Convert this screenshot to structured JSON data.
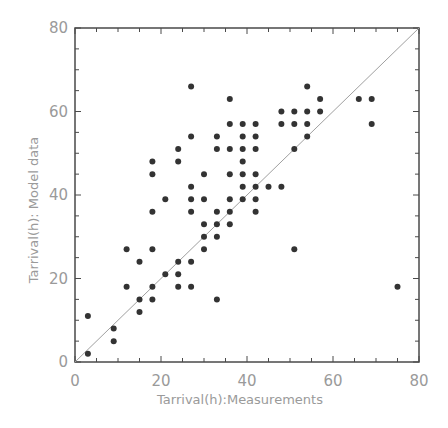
{
  "chart_data": {
    "type": "scatter",
    "title": "",
    "xlabel": "Tarrival(h):Measurements",
    "ylabel": "Tarrival(h): Model data",
    "xlim": [
      0,
      80
    ],
    "ylim": [
      0,
      80
    ],
    "x_ticks": [
      "0",
      "20",
      "40",
      "60",
      "80"
    ],
    "y_ticks": [
      "0",
      "20",
      "40",
      "60",
      "80"
    ],
    "grid": false,
    "legend": null,
    "reference_line": {
      "label": "1:1 line",
      "from": [
        0,
        0
      ],
      "to": [
        80,
        80
      ]
    },
    "series": [
      {
        "name": "points",
        "points": [
          [
            3,
            2
          ],
          [
            3,
            11
          ],
          [
            9,
            8
          ],
          [
            9,
            5
          ],
          [
            12,
            18
          ],
          [
            12,
            27
          ],
          [
            15,
            15
          ],
          [
            15,
            12
          ],
          [
            15,
            24
          ],
          [
            18,
            18
          ],
          [
            18,
            15
          ],
          [
            18,
            27
          ],
          [
            18,
            36
          ],
          [
            18,
            45
          ],
          [
            18,
            48
          ],
          [
            21,
            21
          ],
          [
            21,
            39
          ],
          [
            24,
            24
          ],
          [
            24,
            21
          ],
          [
            24,
            18
          ],
          [
            24,
            48
          ],
          [
            24,
            51
          ],
          [
            27,
            24
          ],
          [
            27,
            18
          ],
          [
            27,
            36
          ],
          [
            27,
            39
          ],
          [
            27,
            42
          ],
          [
            27,
            54
          ],
          [
            27,
            66
          ],
          [
            30,
            30
          ],
          [
            30,
            27
          ],
          [
            30,
            33
          ],
          [
            30,
            39
          ],
          [
            30,
            45
          ],
          [
            33,
            33
          ],
          [
            33,
            30
          ],
          [
            33,
            36
          ],
          [
            33,
            15
          ],
          [
            33,
            51
          ],
          [
            33,
            54
          ],
          [
            36,
            36
          ],
          [
            36,
            33
          ],
          [
            36,
            39
          ],
          [
            36,
            45
          ],
          [
            36,
            51
          ],
          [
            36,
            57
          ],
          [
            36,
            63
          ],
          [
            39,
            39
          ],
          [
            39,
            42
          ],
          [
            39,
            45
          ],
          [
            39,
            48
          ],
          [
            39,
            51
          ],
          [
            39,
            54
          ],
          [
            39,
            57
          ],
          [
            42,
            42
          ],
          [
            42,
            36
          ],
          [
            42,
            39
          ],
          [
            42,
            45
          ],
          [
            42,
            51
          ],
          [
            42,
            54
          ],
          [
            42,
            57
          ],
          [
            45,
            42
          ],
          [
            48,
            42
          ],
          [
            48,
            57
          ],
          [
            48,
            60
          ],
          [
            51,
            51
          ],
          [
            51,
            57
          ],
          [
            51,
            60
          ],
          [
            51,
            27
          ],
          [
            54,
            54
          ],
          [
            54,
            57
          ],
          [
            54,
            60
          ],
          [
            54,
            66
          ],
          [
            57,
            60
          ],
          [
            57,
            63
          ],
          [
            66,
            63
          ],
          [
            69,
            63
          ],
          [
            69,
            57
          ],
          [
            75,
            18
          ]
        ]
      }
    ]
  }
}
